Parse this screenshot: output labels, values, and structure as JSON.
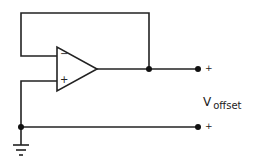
{
  "diagram": {
    "type": "op-amp voltage follower offset measurement circuit",
    "opamp": {
      "inverting_input_label": "−",
      "noninverting_input_label": "+"
    },
    "terminals": [
      {
        "id": "output-terminal",
        "polarity": "+"
      },
      {
        "id": "ground-terminal",
        "polarity": "+"
      }
    ],
    "label": {
      "main": "V",
      "subscript": "offset"
    },
    "colors": {
      "line": "#222222",
      "background": "#ffffff"
    }
  }
}
